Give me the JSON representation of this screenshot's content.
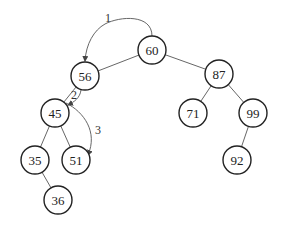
{
  "diagram": {
    "type": "binary-search-tree",
    "root": "60",
    "nodes": [
      {
        "id": "60",
        "label": "60"
      },
      {
        "id": "56",
        "label": "56"
      },
      {
        "id": "87",
        "label": "87"
      },
      {
        "id": "45",
        "label": "45"
      },
      {
        "id": "71",
        "label": "71"
      },
      {
        "id": "99",
        "label": "99"
      },
      {
        "id": "35",
        "label": "35"
      },
      {
        "id": "51",
        "label": "51"
      },
      {
        "id": "92",
        "label": "92"
      },
      {
        "id": "36",
        "label": "36"
      }
    ],
    "edges": [
      {
        "from": "60",
        "to": "56"
      },
      {
        "from": "60",
        "to": "87"
      },
      {
        "from": "56",
        "to": "45"
      },
      {
        "from": "87",
        "to": "71"
      },
      {
        "from": "87",
        "to": "99"
      },
      {
        "from": "45",
        "to": "35"
      },
      {
        "from": "45",
        "to": "51"
      },
      {
        "from": "99",
        "to": "92"
      },
      {
        "from": "35",
        "to": "36"
      }
    ],
    "search_steps": [
      {
        "label": "1",
        "from": "60",
        "to": "56"
      },
      {
        "label": "2",
        "from": "56",
        "to": "45"
      },
      {
        "label": "3",
        "from": "45",
        "to": "51"
      }
    ]
  }
}
